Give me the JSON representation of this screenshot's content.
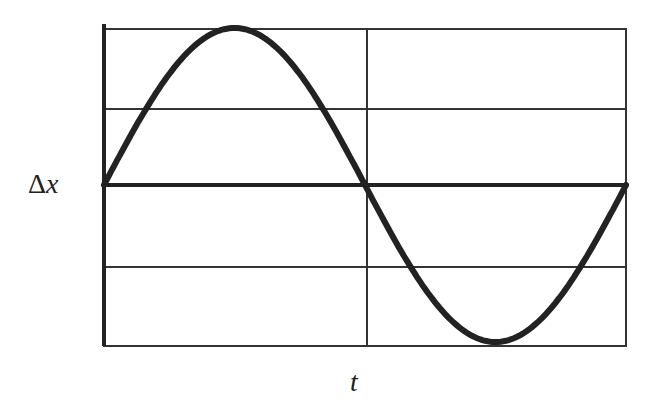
{
  "chart_data": {
    "type": "line",
    "title": "",
    "xlabel": "t",
    "ylabel": "Δx",
    "series": [
      {
        "name": "Δx(t)",
        "function": "sine",
        "periods": 1,
        "start_phase": 0
      }
    ],
    "x": [
      0,
      0.25,
      0.5,
      0.75,
      1.0
    ],
    "values": [
      0,
      1,
      0,
      -1,
      0
    ],
    "ylim": [
      -1,
      1
    ],
    "grid": true,
    "grid_lines": {
      "horizontal": 4,
      "vertical": 2
    }
  },
  "labels": {
    "y_axis_symbol": "Δ",
    "y_axis_var": "x",
    "x_axis": "t"
  },
  "colors": {
    "line": "#222222",
    "grid": "#333333",
    "background": "#ffffff"
  }
}
